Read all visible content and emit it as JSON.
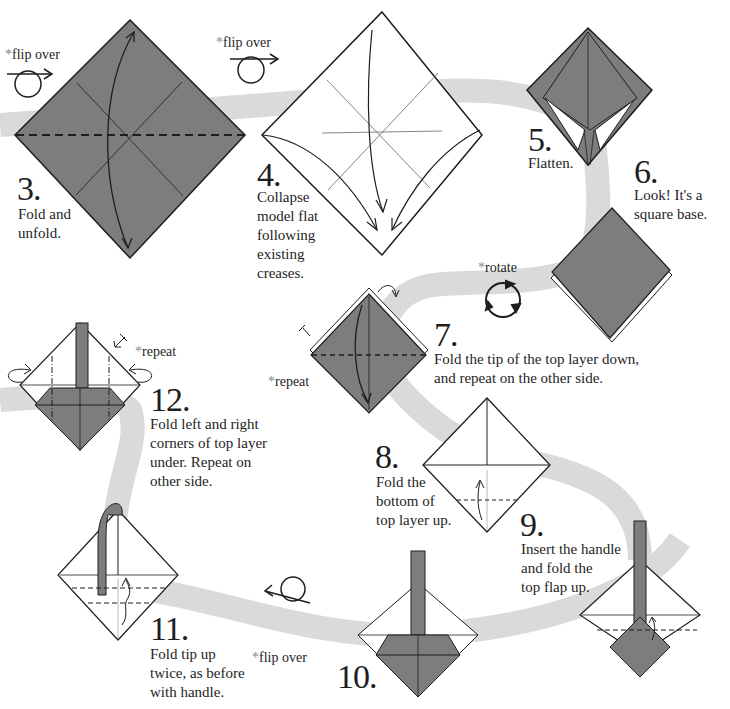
{
  "colors": {
    "paper": "#7d7d7d",
    "path": "#dadada",
    "line": "#1e1e1e",
    "background": "#ffffff"
  },
  "notes": {
    "flip_over_1": "flip over",
    "flip_over_2": "flip over",
    "flip_over_3": "flip over",
    "rotate": "rotate",
    "repeat_7": "repeat",
    "repeat_12": "repeat",
    "asterisk": "*"
  },
  "steps": [
    {
      "number": "3.",
      "lines": [
        "Fold and",
        "unfold."
      ]
    },
    {
      "number": "4.",
      "lines": [
        "Collapse",
        "model flat",
        "following",
        "existing",
        "creases."
      ]
    },
    {
      "number": "5.",
      "lines": [
        "Flatten."
      ]
    },
    {
      "number": "6.",
      "lines": [
        "Look! It's a",
        "square base."
      ]
    },
    {
      "number": "7.",
      "lines": [
        "Fold the tip of the top layer down,",
        "and repeat on the other side."
      ]
    },
    {
      "number": "8.",
      "lines": [
        "Fold the",
        "bottom of",
        "top layer up."
      ]
    },
    {
      "number": "9.",
      "lines": [
        "Insert the handle",
        "and fold the",
        "top flap up."
      ]
    },
    {
      "number": "10.",
      "lines": []
    },
    {
      "number": "11.",
      "lines": [
        "Fold tip up",
        "twice, as before",
        "with handle."
      ]
    },
    {
      "number": "12.",
      "lines": [
        "Fold left and right",
        "corners of top layer",
        "under. Repeat on",
        "other side."
      ]
    }
  ],
  "icons": [
    "flip-over-icon",
    "rotate-icon",
    "fold-arrow-icon",
    "repeat-arrow-icon"
  ]
}
